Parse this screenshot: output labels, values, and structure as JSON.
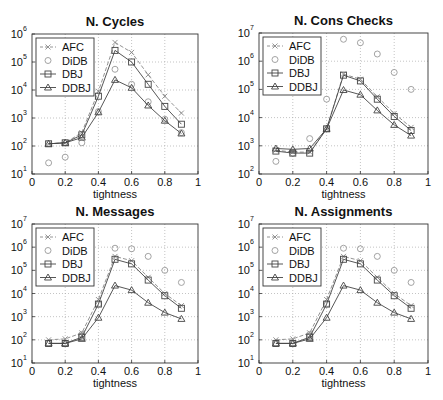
{
  "chart_data": [
    {
      "type": "line",
      "title": "N. Cycles",
      "xlabel": "tightness",
      "ylabel": "",
      "yscale": "log",
      "xlim": [
        0,
        1
      ],
      "ylim": [
        10,
        1000000
      ],
      "xticks": [
        "0",
        "0.2",
        "0.4",
        "0.6",
        "0.8",
        "1"
      ],
      "yticks_exp": [
        1,
        2,
        3,
        4,
        5,
        6
      ],
      "grid": true,
      "legend_position": "upper left",
      "x": [
        0.1,
        0.2,
        0.3,
        0.4,
        0.5,
        0.6,
        0.7,
        0.8,
        0.9
      ],
      "series": [
        {
          "name": "AFC",
          "marker": "x",
          "dash": true,
          "values": [
            120,
            130,
            300,
            9000,
            500000,
            220000,
            35000,
            6000,
            1500
          ]
        },
        {
          "name": "DiDB",
          "marker": "o",
          "dash": false,
          "noline": true,
          "values": [
            25,
            40,
            130,
            1700,
            55000,
            16000,
            3800,
            900,
            300
          ]
        },
        {
          "name": "DBJ",
          "marker": "s",
          "dash": false,
          "values": [
            120,
            130,
            250,
            6000,
            260000,
            100000,
            16000,
            2600,
            600
          ]
        },
        {
          "name": "DDBJ",
          "marker": "^",
          "dash": false,
          "values": [
            120,
            130,
            200,
            1600,
            23000,
            12000,
            2800,
            800,
            280
          ]
        }
      ]
    },
    {
      "type": "line",
      "title": "N. Cons Checks",
      "xlabel": "tightness",
      "ylabel": "",
      "yscale": "log",
      "xlim": [
        0,
        1
      ],
      "ylim": [
        100,
        10000000
      ],
      "xticks": [
        "0",
        "0.2",
        "0.4",
        "0.6",
        "0.8",
        "1"
      ],
      "yticks_exp": [
        2,
        3,
        4,
        5,
        6,
        7
      ],
      "grid": true,
      "legend_position": "upper left",
      "x": [
        0.1,
        0.2,
        0.3,
        0.4,
        0.5,
        0.6,
        0.7,
        0.8,
        0.9
      ],
      "series": [
        {
          "name": "AFC",
          "marker": "x",
          "dash": true,
          "values": [
            700,
            600,
            600,
            4000,
            350000,
            230000,
            55000,
            14000,
            4500
          ]
        },
        {
          "name": "DiDB",
          "marker": "o",
          "dash": false,
          "noline": true,
          "values": [
            280,
            550,
            1800,
            45000,
            6000000,
            4500000,
            1800000,
            400000,
            100000
          ]
        },
        {
          "name": "DBJ",
          "marker": "s",
          "dash": false,
          "values": [
            650,
            550,
            550,
            4000,
            320000,
            200000,
            45000,
            11000,
            3500
          ]
        },
        {
          "name": "DDBJ",
          "marker": "^",
          "dash": false,
          "values": [
            800,
            750,
            800,
            4000,
            95000,
            65000,
            18000,
            5500,
            2300
          ]
        }
      ]
    },
    {
      "type": "line",
      "title": "N. Messages",
      "xlabel": "tightness",
      "ylabel": "",
      "yscale": "log",
      "xlim": [
        0,
        1
      ],
      "ylim": [
        10,
        10000000
      ],
      "xticks": [
        "0",
        "0.2",
        "0.4",
        "0.6",
        "0.8",
        "1"
      ],
      "yticks_exp": [
        1,
        2,
        3,
        4,
        5,
        6,
        7
      ],
      "grid": true,
      "legend_position": "upper left",
      "x": [
        0.1,
        0.2,
        0.3,
        0.4,
        0.5,
        0.6,
        0.7,
        0.8,
        0.9
      ],
      "series": [
        {
          "name": "AFC",
          "marker": "x",
          "dash": true,
          "values": [
            100,
            110,
            200,
            5500,
            400000,
            260000,
            50000,
            10000,
            3000
          ]
        },
        {
          "name": "DiDB",
          "marker": "o",
          "dash": false,
          "noline": true,
          "values": [
            70,
            70,
            170,
            3500,
            900000,
            850000,
            400000,
            100000,
            30000
          ]
        },
        {
          "name": "DBJ",
          "marker": "s",
          "dash": false,
          "values": [
            70,
            70,
            130,
            3500,
            300000,
            190000,
            38000,
            8000,
            2300
          ]
        },
        {
          "name": "DDBJ",
          "marker": "^",
          "dash": false,
          "values": [
            70,
            70,
            110,
            900,
            22000,
            14000,
            4000,
            1500,
            800
          ]
        }
      ]
    },
    {
      "type": "line",
      "title": "N. Assignments",
      "xlabel": "tightness",
      "ylabel": "",
      "yscale": "log",
      "xlim": [
        0,
        1
      ],
      "ylim": [
        10,
        10000000
      ],
      "xticks": [
        "0",
        "0.2",
        "0.4",
        "0.6",
        "0.8",
        "1"
      ],
      "yticks_exp": [
        1,
        2,
        3,
        4,
        5,
        6,
        7
      ],
      "grid": true,
      "legend_position": "upper left",
      "x": [
        0.1,
        0.2,
        0.3,
        0.4,
        0.5,
        0.6,
        0.7,
        0.8,
        0.9
      ],
      "series": [
        {
          "name": "AFC",
          "marker": "x",
          "dash": true,
          "values": [
            100,
            110,
            200,
            5500,
            400000,
            260000,
            50000,
            10000,
            3000
          ]
        },
        {
          "name": "DiDB",
          "marker": "o",
          "dash": false,
          "noline": true,
          "values": [
            70,
            70,
            170,
            3500,
            900000,
            850000,
            400000,
            100000,
            30000
          ]
        },
        {
          "name": "DBJ",
          "marker": "s",
          "dash": false,
          "values": [
            70,
            70,
            130,
            3500,
            300000,
            190000,
            38000,
            8000,
            2300
          ]
        },
        {
          "name": "DDBJ",
          "marker": "^",
          "dash": false,
          "values": [
            70,
            70,
            110,
            900,
            22000,
            14000,
            4000,
            1500,
            800
          ]
        }
      ]
    }
  ],
  "layout": {
    "panels": [
      {
        "left": 0,
        "top": 0,
        "ax": [
          32,
          34,
          198,
          174
        ]
      },
      {
        "left": 222,
        "top": 0,
        "ax": [
          37,
          33,
          206,
          174
        ]
      },
      {
        "left": 0,
        "top": 200,
        "ax": [
          32,
          24,
          198,
          163
        ]
      },
      {
        "left": 222,
        "top": 200,
        "ax": [
          37,
          24,
          206,
          163
        ]
      }
    ],
    "colors": {
      "line": "#444444",
      "afc": "#888888",
      "didb": "#999999",
      "grid": "#aaaaaa",
      "axis": "#333333"
    }
  }
}
